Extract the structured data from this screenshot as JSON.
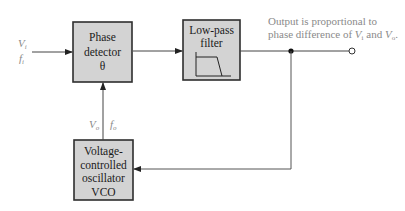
{
  "diagram": {
    "type": "block-diagram",
    "colors": {
      "box_fill": "#d3d3d3",
      "box_border": "#2e2e2e",
      "line": "#444444",
      "annotation_text": "#8a8a8a"
    },
    "blocks": [
      {
        "id": "phase-detector",
        "lines": [
          "Phase",
          "detector",
          "θ"
        ]
      },
      {
        "id": "low-pass-filter",
        "lines": [
          "Low-pass",
          "filter"
        ],
        "icon": "low-pass-response-icon"
      },
      {
        "id": "vco",
        "lines": [
          "Voltage-",
          "controlled",
          "oscillator",
          "VCO"
        ]
      }
    ],
    "input": {
      "voltage": "V",
      "voltage_sub": "i",
      "freq": "f",
      "freq_sub": "i"
    },
    "feedback_labels": {
      "voltage": "V",
      "voltage_sub": "o",
      "freq": "f",
      "freq_sub": "o"
    },
    "output_note": {
      "line1": "Output is proportional to",
      "line2_prefix": "phase difference of ",
      "v1": "V",
      "v1_sub": "i",
      "and": " and ",
      "v2": "V",
      "v2_sub": "o",
      "suffix": "."
    },
    "connections": [
      {
        "from": "input",
        "to": "phase-detector"
      },
      {
        "from": "phase-detector",
        "to": "low-pass-filter"
      },
      {
        "from": "low-pass-filter",
        "to": "output-terminal"
      },
      {
        "from": "junction",
        "to": "vco"
      },
      {
        "from": "vco",
        "to": "phase-detector"
      }
    ]
  }
}
